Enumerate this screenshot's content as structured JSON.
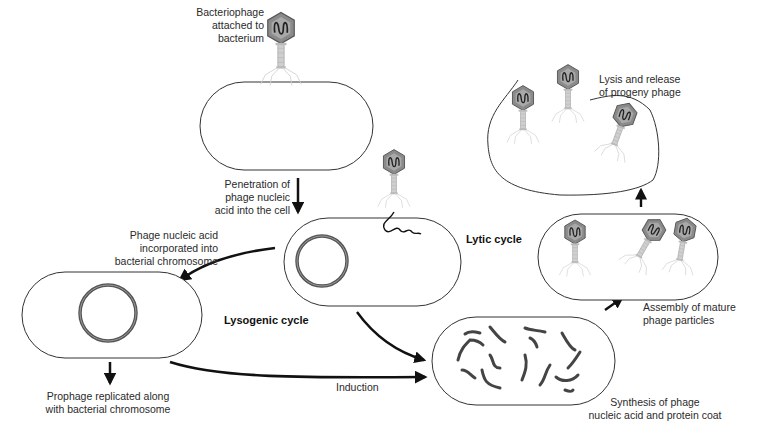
{
  "diagram": {
    "labels": {
      "attached": [
        "Bacteriophage",
        "attached to",
        "bacterium"
      ],
      "penetration": [
        "Penetration of",
        "phage nucleic",
        "acid into the cell"
      ],
      "incorporated": [
        "Phage nucleic acid",
        "incorporated into",
        "bacterial chromosome"
      ],
      "lytic_cycle": "Lytic cycle",
      "lysogenic_cycle": "Lysogenic cycle",
      "prophage": [
        "Prophage replicated along",
        "with bacterial chromosome"
      ],
      "induction": "Induction",
      "synthesis": [
        "Synthesis of phage",
        "nucleic acid and protein coat"
      ],
      "assembly": [
        "Assembly of mature",
        "phage particles"
      ],
      "lysis": [
        "Lysis and release",
        "of progeny phage"
      ]
    },
    "nodes": [
      {
        "id": "attachment",
        "label": "Bacteriophage attached to bacterium"
      },
      {
        "id": "penetration",
        "label": "Penetration of phage nucleic acid into the cell"
      },
      {
        "id": "lysogen",
        "label": "Phage nucleic acid incorporated into bacterial chromosome"
      },
      {
        "id": "prophage",
        "label": "Prophage replicated along with bacterial chromosome"
      },
      {
        "id": "synthesis",
        "label": "Synthesis of phage nucleic acid and protein coat"
      },
      {
        "id": "assembly",
        "label": "Assembly of mature phage particles"
      },
      {
        "id": "lysis",
        "label": "Lysis and release of progeny phage"
      }
    ],
    "edges": [
      {
        "from": "attachment",
        "to": "penetration"
      },
      {
        "from": "penetration",
        "to": "lysogen",
        "label": "Lysogenic cycle"
      },
      {
        "from": "penetration",
        "to": "synthesis",
        "label": "Lytic cycle"
      },
      {
        "from": "lysogen",
        "to": "prophage"
      },
      {
        "from": "lysogen",
        "to": "synthesis",
        "label": "Induction"
      },
      {
        "from": "synthesis",
        "to": "assembly"
      },
      {
        "from": "assembly",
        "to": "lysis"
      }
    ],
    "colors": {
      "outline": "#333333",
      "arrow": "#111111",
      "capsid": "#8a8a8a",
      "capsid_dark": "#555555",
      "tail": "#c8c8c8",
      "dna": "#444444"
    }
  }
}
